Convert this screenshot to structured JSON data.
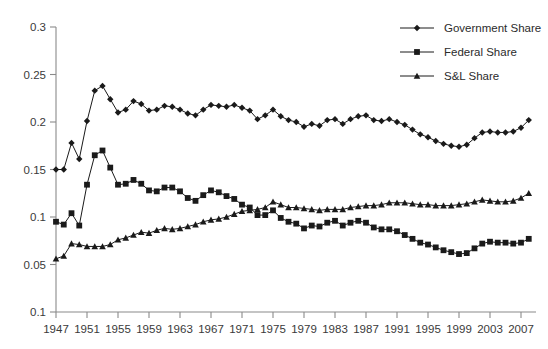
{
  "chart_data": {
    "type": "line",
    "title": "",
    "subtitle": "",
    "xlabel": "",
    "ylabel": "",
    "grid": false,
    "legend_position": "top-right",
    "xlim": [
      1947,
      2008
    ],
    "ylim": [
      0,
      0.3
    ],
    "x_tick_labels": [
      "1947",
      "1951",
      "1955",
      "1959",
      "1963",
      "1967",
      "1971",
      "1975",
      "1979",
      "1983",
      "1987",
      "1991",
      "1995",
      "1999",
      "2003",
      "2007"
    ],
    "x_tick_values": [
      1947,
      1951,
      1955,
      1959,
      1963,
      1967,
      1971,
      1975,
      1979,
      1983,
      1987,
      1991,
      1995,
      1999,
      2003,
      2007
    ],
    "y_tick_labels": [
      "0.3",
      "0.25",
      "0.2",
      "0.15",
      "0.1",
      "0.05",
      "0.1"
    ],
    "y_tick_values": [
      0.3,
      0.25,
      0.2,
      0.15,
      0.1,
      0.05,
      0.0
    ],
    "x": [
      1947,
      1948,
      1949,
      1950,
      1951,
      1952,
      1953,
      1954,
      1955,
      1956,
      1957,
      1958,
      1959,
      1960,
      1961,
      1962,
      1963,
      1964,
      1965,
      1966,
      1967,
      1968,
      1969,
      1970,
      1971,
      1972,
      1973,
      1974,
      1975,
      1976,
      1977,
      1978,
      1979,
      1980,
      1981,
      1982,
      1983,
      1984,
      1985,
      1986,
      1987,
      1988,
      1989,
      1990,
      1991,
      1992,
      1993,
      1994,
      1995,
      1996,
      1997,
      1998,
      1999,
      2000,
      2001,
      2002,
      2003,
      2004,
      2005,
      2006,
      2007,
      2008
    ],
    "series": [
      {
        "name": "Government Share",
        "marker": "diamond",
        "color": "#1a1a1a",
        "values": [
          0.15,
          0.15,
          0.178,
          0.161,
          0.201,
          0.233,
          0.238,
          0.224,
          0.21,
          0.213,
          0.222,
          0.219,
          0.212,
          0.213,
          0.217,
          0.216,
          0.213,
          0.209,
          0.207,
          0.213,
          0.218,
          0.217,
          0.216,
          0.218,
          0.215,
          0.212,
          0.203,
          0.207,
          0.213,
          0.206,
          0.202,
          0.2,
          0.195,
          0.198,
          0.196,
          0.202,
          0.203,
          0.198,
          0.203,
          0.206,
          0.207,
          0.202,
          0.201,
          0.203,
          0.2,
          0.197,
          0.192,
          0.187,
          0.184,
          0.18,
          0.177,
          0.175,
          0.174,
          0.176,
          0.183,
          0.189,
          0.19,
          0.189,
          0.189,
          0.19,
          0.194,
          0.202
        ]
      },
      {
        "name": "Federal Share",
        "marker": "square",
        "color": "#1a1a1a",
        "values": [
          0.095,
          0.092,
          0.104,
          0.091,
          0.134,
          0.165,
          0.17,
          0.152,
          0.134,
          0.135,
          0.139,
          0.135,
          0.128,
          0.127,
          0.131,
          0.131,
          0.127,
          0.12,
          0.117,
          0.123,
          0.128,
          0.126,
          0.122,
          0.119,
          0.113,
          0.11,
          0.102,
          0.102,
          0.107,
          0.099,
          0.095,
          0.093,
          0.088,
          0.091,
          0.09,
          0.094,
          0.096,
          0.091,
          0.094,
          0.096,
          0.094,
          0.089,
          0.087,
          0.087,
          0.085,
          0.081,
          0.077,
          0.073,
          0.071,
          0.068,
          0.065,
          0.063,
          0.061,
          0.062,
          0.067,
          0.072,
          0.074,
          0.073,
          0.073,
          0.072,
          0.073,
          0.077
        ]
      },
      {
        "name": "S&L Share",
        "marker": "triangle",
        "color": "#1a1a1a",
        "values": [
          0.056,
          0.059,
          0.072,
          0.071,
          0.069,
          0.069,
          0.069,
          0.071,
          0.076,
          0.078,
          0.081,
          0.084,
          0.083,
          0.086,
          0.088,
          0.087,
          0.088,
          0.09,
          0.092,
          0.095,
          0.097,
          0.098,
          0.1,
          0.103,
          0.106,
          0.107,
          0.108,
          0.11,
          0.116,
          0.113,
          0.11,
          0.11,
          0.109,
          0.108,
          0.107,
          0.108,
          0.108,
          0.108,
          0.11,
          0.111,
          0.112,
          0.112,
          0.113,
          0.115,
          0.115,
          0.115,
          0.114,
          0.113,
          0.113,
          0.112,
          0.112,
          0.112,
          0.113,
          0.114,
          0.116,
          0.118,
          0.117,
          0.116,
          0.116,
          0.117,
          0.12,
          0.125
        ]
      }
    ]
  },
  "legend": {
    "items": [
      {
        "label": "Government Share",
        "marker": "diamond"
      },
      {
        "label": "Federal Share",
        "marker": "square"
      },
      {
        "label": "S&L Share",
        "marker": "triangle"
      }
    ]
  }
}
